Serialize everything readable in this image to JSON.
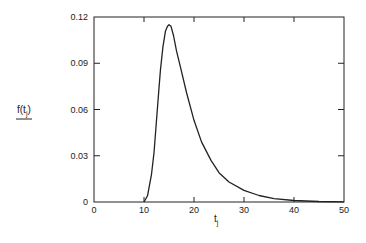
{
  "chart_data": {
    "type": "line",
    "title": "",
    "xlabel": "t",
    "xlabel_subscript": "j",
    "ylabel": "f(t",
    "ylabel_subscript": "j",
    "ylabel_close": ")",
    "xlim": [
      0,
      50
    ],
    "ylim": [
      0,
      0.12
    ],
    "x_ticks": [
      0,
      10,
      20,
      30,
      40,
      50
    ],
    "x_tick_labels": [
      "0",
      "10",
      "20",
      "30",
      "40",
      "50"
    ],
    "y_ticks": [
      0,
      0.03,
      0.06,
      0.09,
      0.12
    ],
    "y_tick_labels": [
      "0",
      "0.03",
      "0.06",
      "0.09",
      "0.12"
    ],
    "grid": false,
    "legend": null,
    "series": [
      {
        "name": "f(t_j)",
        "x": [
          10,
          10.7,
          11.5,
          12,
          12.5,
          13,
          13.3,
          13.8,
          14.3,
          14.7,
          15,
          15.4,
          15.9,
          16.5,
          17.4,
          18.5,
          20,
          21.5,
          23.4,
          25,
          27,
          30,
          33,
          36,
          40,
          45,
          50
        ],
        "values": [
          0,
          0.004,
          0.018,
          0.032,
          0.053,
          0.074,
          0.086,
          0.101,
          0.111,
          0.114,
          0.115,
          0.114,
          0.108,
          0.098,
          0.086,
          0.071,
          0.053,
          0.039,
          0.027,
          0.019,
          0.013,
          0.0075,
          0.0042,
          0.0022,
          0.001,
          0.0003,
          0.0001
        ]
      }
    ],
    "peak": {
      "x": 15,
      "y": 0.115
    }
  }
}
